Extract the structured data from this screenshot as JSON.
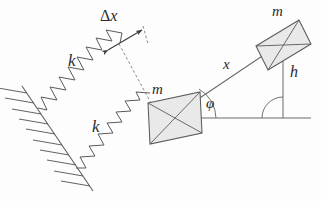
{
  "figure": {
    "background_color": "#fdfdfd",
    "stroke_color": "#555555",
    "block_fill_color": "#e9e9e9",
    "labels": {
      "spring_constant_upper": "k",
      "spring_constant_lower": "k",
      "mass_left": "m",
      "mass_right": "m",
      "displacement": "Δx",
      "displacement_delta": "Δ",
      "displacement_var": "x",
      "distance_x": "x",
      "height_h": "h",
      "angle_phi": "φ"
    },
    "elements": {
      "wall": "hatched-fixed-support",
      "springs": 2,
      "masses": 2,
      "baseline": "horizontal-ground-line",
      "trajectory": "inclined-line",
      "right_angle_marker": true,
      "dimension_arrow": "double-headed"
    }
  },
  "geometry": {
    "mass_left_center": [
      175,
      118
    ],
    "mass_right_center": [
      283,
      45
    ],
    "baseline_y": 118,
    "baseline_x_start": 185,
    "baseline_x_end": 311,
    "wall_top": [
      22,
      88
    ],
    "wall_bottom": [
      92,
      190
    ],
    "angle_phi_degrees": 34
  }
}
